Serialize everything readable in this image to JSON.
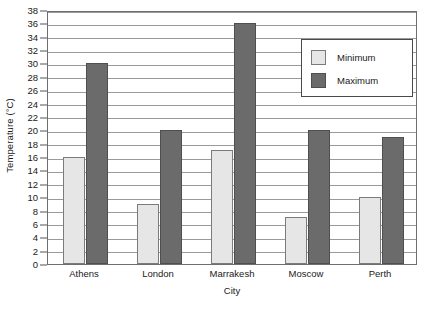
{
  "chart_data": {
    "type": "bar",
    "title": "",
    "xlabel": "City",
    "ylabel": "Temperature (°C)",
    "ylim": [
      0,
      38
    ],
    "ytick_step": 2,
    "yticks": [
      0,
      2,
      4,
      6,
      8,
      10,
      12,
      14,
      16,
      18,
      20,
      22,
      24,
      26,
      28,
      30,
      32,
      34,
      36,
      38
    ],
    "grid": "horizontal",
    "legend_position": "top-right",
    "categories": [
      "Athens",
      "London",
      "Marrakesh",
      "Moscow",
      "Perth"
    ],
    "series": [
      {
        "name": "Minimum",
        "color": "#e6e6e6",
        "values": [
          16,
          9,
          17,
          7,
          10
        ]
      },
      {
        "name": "Maximum",
        "color": "#6b6b6b",
        "values": [
          30,
          20,
          36,
          20,
          19
        ]
      }
    ]
  },
  "legend": {
    "items": [
      {
        "label": "Minimum",
        "swatch": "minimum-swatch"
      },
      {
        "label": "Maximum",
        "swatch": "maximum-swatch"
      }
    ]
  }
}
